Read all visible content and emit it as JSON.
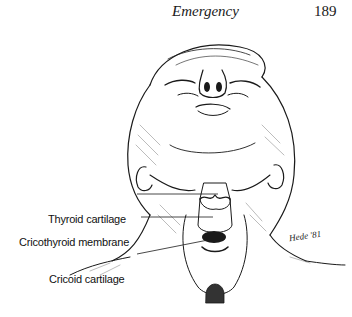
{
  "page": {
    "running_head": "Emergency",
    "page_number": "189"
  },
  "figure": {
    "labels": [
      {
        "id": "thyroid",
        "text": "Thyroid cartilage"
      },
      {
        "id": "cricothyroid",
        "text": "Cricothyroid membrane"
      },
      {
        "id": "cricoid",
        "text": "Cricoid cartilage"
      }
    ],
    "artist_signature": "Hede '81"
  },
  "colors": {
    "ink": "#1a1a1a",
    "paper": "#ffffff"
  }
}
